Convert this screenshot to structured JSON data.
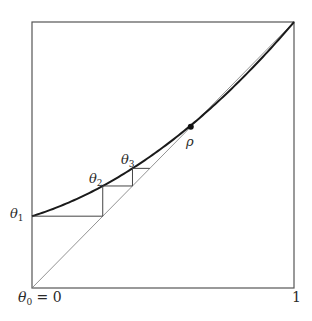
{
  "figure": {
    "type": "cobweb-diagram",
    "colors": {
      "frame": "#555555",
      "diagonal": "#777777",
      "curve": "#1a1a1a",
      "cobweb": "#444444",
      "point": "#111111"
    },
    "box": {
      "left": 32,
      "top": 22,
      "right": 294,
      "bottom": 288
    },
    "function": {
      "form": "f(theta) = a + b*theta + c*theta^2",
      "a": 0.27,
      "b": 0.306,
      "c": 0.424
    },
    "labels": {
      "theta0_sym": "θ",
      "theta0_sub": "0",
      "theta0_eq": " = 0",
      "one": "1",
      "theta1_sym": "θ",
      "theta1_sub": "1",
      "theta2_sym": "θ",
      "theta2_sub": "2",
      "theta3_sym": "θ",
      "theta3_sub": "3",
      "rho": "ρ"
    },
    "points": {
      "theta1": 0.27,
      "theta2": 0.39,
      "theta3": 0.46,
      "rho": 0.606
    }
  }
}
